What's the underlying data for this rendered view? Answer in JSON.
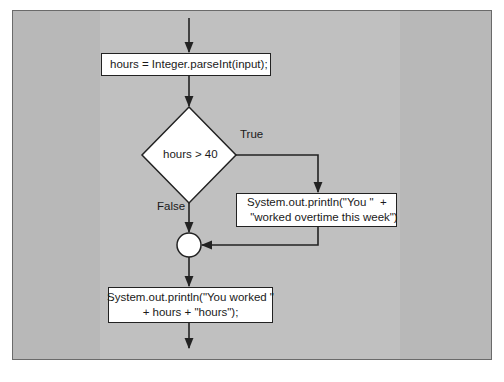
{
  "diagram": {
    "type": "flowchart",
    "nodes": {
      "assign": {
        "kind": "process",
        "lines": [
          "hours = Integer.parseInt(input);"
        ]
      },
      "decision": {
        "kind": "decision",
        "text": "hours > 40"
      },
      "overtime": {
        "kind": "process",
        "lines": [
          "System.out.println(\"You \"  +",
          " \"worked overtime this week\")"
        ]
      },
      "merge": {
        "kind": "connector"
      },
      "worked": {
        "kind": "process",
        "lines": [
          "System.out.println(\"You worked \"",
          "+ hours + \"hours\");"
        ]
      }
    },
    "edge_labels": {
      "true": "True",
      "false": "False"
    },
    "edges": [
      {
        "from": "start",
        "to": "assign"
      },
      {
        "from": "assign",
        "to": "decision"
      },
      {
        "from": "decision",
        "to": "overtime",
        "label": "True"
      },
      {
        "from": "decision",
        "to": "merge",
        "label": "False"
      },
      {
        "from": "overtime",
        "to": "merge"
      },
      {
        "from": "merge",
        "to": "worked"
      },
      {
        "from": "worked",
        "to": "end"
      }
    ],
    "colors": {
      "background": "#b8b8b8",
      "inner_column": "#c0c0c0",
      "node_fill": "#ffffff",
      "stroke": "#222222"
    }
  }
}
